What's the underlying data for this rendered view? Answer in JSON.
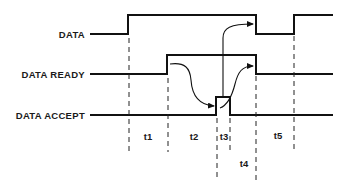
{
  "diagram": {
    "type": "timing-diagram",
    "signals": [
      {
        "name": "DATA"
      },
      {
        "name": "DATA READY"
      },
      {
        "name": "DATA ACCEPT"
      }
    ],
    "intervals": [
      {
        "label": "t1"
      },
      {
        "label": "t2"
      },
      {
        "label": "t3"
      },
      {
        "label": "t4"
      },
      {
        "label": "t5"
      }
    ],
    "colors": {
      "line": "#111111",
      "background": "#ffffff"
    }
  }
}
